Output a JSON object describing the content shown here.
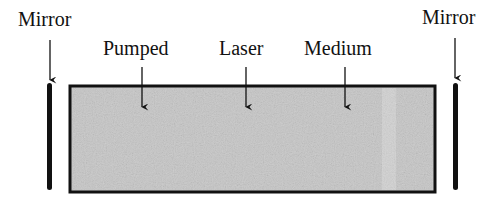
{
  "diagram": {
    "labels": {
      "mirror_left": "Mirror",
      "mirror_right": "Mirror",
      "pumped": "Pumped",
      "laser": "Laser",
      "medium": "Medium"
    },
    "colors": {
      "medium_fill": "#c9c9c9",
      "outline": "#111111",
      "mirror": "#111111"
    }
  }
}
